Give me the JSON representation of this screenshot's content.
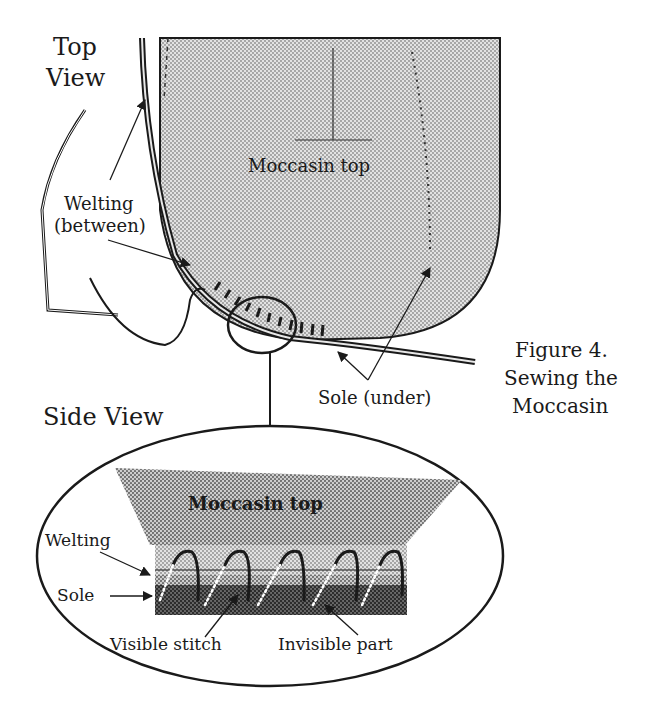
{
  "figure": {
    "caption_line1": "Figure 4.",
    "caption_line2": "Sewing the",
    "caption_line3": "Moccasin"
  },
  "top_view": {
    "heading_line1": "Top",
    "heading_line2": "View",
    "labels": {
      "moccasin_top": "Moccasin top",
      "welting_line1": "Welting",
      "welting_line2": "(between)",
      "sole": "Sole (under)"
    }
  },
  "side_view": {
    "heading": "Side View",
    "labels": {
      "moccasin_top": "Moccasin top",
      "welting": "Welting",
      "sole": "Sole",
      "visible_stitch": "Visible stitch",
      "invisible_part": "Invisible part"
    }
  },
  "colors": {
    "ink": "#1a1a1a",
    "moccasin_top_fill": "#c8c8c8",
    "side_top_fill": "#a8a8a8",
    "welting_fill": "#bcbcbc",
    "sole_fill": "#4a4a4a",
    "background": "#ffffff"
  }
}
